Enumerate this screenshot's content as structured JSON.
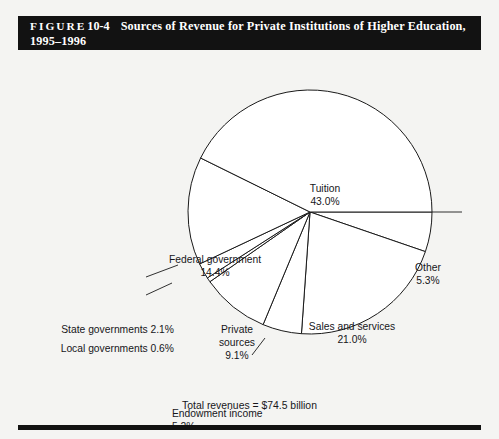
{
  "figure": {
    "label_word": "FIGURE",
    "number": "10-4",
    "title_line1": "Sources of Revenue for Private Institutions of Higher Education,",
    "title_line2": "1995–1996"
  },
  "footer": {
    "total_note": "Total revenues = $74.5 billion"
  },
  "labels": {
    "tuition": {
      "name": "Tuition",
      "value": "43.0%"
    },
    "other": {
      "name": "Other",
      "value": "5.3%"
    },
    "sales": {
      "name": "Sales and services",
      "value": "21.0%"
    },
    "federal": {
      "name": "Federal government",
      "value": "14.4%"
    },
    "private1": {
      "name": "Private",
      "name2": "sources",
      "value": "9.1%"
    },
    "state": {
      "text": "State governments 2.1%"
    },
    "local": {
      "text": "Local governments 0.6%"
    },
    "endow": {
      "name": "Endowment income",
      "value": "5.2%"
    }
  },
  "colors": {
    "banner_bg": "#121212",
    "banner_text": "#ffffff",
    "page_bg": "#f4f4f2",
    "slice_fill": "#ffffff",
    "slice_stroke": "#1a1a1a",
    "text": "#16161a"
  },
  "chart_data": {
    "type": "pie",
    "title": "Sources of Revenue for Private Institutions of Higher Education, 1995–1996",
    "total_label": "Total revenues = $74.5 billion",
    "total_value": 74.5,
    "total_units": "billion USD",
    "unit": "percent",
    "start_angle_deg": 0,
    "direction": "clockwise",
    "legend": "none (direct labels)",
    "grid": false,
    "categories": [
      "Other",
      "Sales and services",
      "Endowment income",
      "Private sources",
      "Local governments",
      "State governments",
      "Federal government",
      "Tuition"
    ],
    "values": [
      5.3,
      21.0,
      5.2,
      9.1,
      0.6,
      2.1,
      14.4,
      43.0
    ],
    "slices": [
      {
        "label": "Other",
        "value": 5.3,
        "display": "5.3%"
      },
      {
        "label": "Sales and services",
        "value": 21.0,
        "display": "21.0%"
      },
      {
        "label": "Endowment income",
        "value": 5.2,
        "display": "5.2%"
      },
      {
        "label": "Private sources",
        "value": 9.1,
        "display": "9.1%"
      },
      {
        "label": "Local governments",
        "value": 0.6,
        "display": "0.6%"
      },
      {
        "label": "State governments",
        "value": 2.1,
        "display": "2.1%"
      },
      {
        "label": "Federal government",
        "value": 14.4,
        "display": "14.4%"
      },
      {
        "label": "Tuition",
        "value": 43.0,
        "display": "43.0%"
      }
    ]
  }
}
